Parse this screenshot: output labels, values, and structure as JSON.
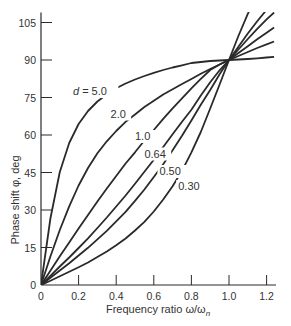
{
  "chart_data": {
    "type": "line",
    "title": "",
    "xlabel": "Frequency ratio ω/ω_n",
    "xlabel_main": "Frequency ratio ω/ω",
    "xlabel_sub": "n",
    "ylabel": "Phase shift φ, deg",
    "xlim": [
      0,
      1.25
    ],
    "ylim": [
      0,
      108
    ],
    "x_ticks": [
      0,
      0.2,
      0.4,
      0.6,
      0.8,
      1.0,
      1.2
    ],
    "x_tick_labels": [
      "0",
      "0.2",
      "0.4",
      "0.6",
      "0.8",
      "1.0",
      "1.2"
    ],
    "y_ticks": [
      0,
      15,
      30,
      45,
      60,
      75,
      90,
      105
    ],
    "y_tick_labels": [
      "0",
      "15",
      "30",
      "45",
      "60",
      "75",
      "90",
      "105"
    ],
    "grid": false,
    "legend": "inline labels on curves",
    "curve_parameter": "d",
    "x": [
      0,
      0.05,
      0.1,
      0.15,
      0.2,
      0.25,
      0.3,
      0.35,
      0.4,
      0.45,
      0.5,
      0.55,
      0.6,
      0.65,
      0.7,
      0.75,
      0.8,
      0.85,
      0.9,
      0.95,
      1.0,
      1.05,
      1.1,
      1.15,
      1.2,
      1.24
    ],
    "series": [
      {
        "name": "d = 5.0",
        "label": "d = 5.0",
        "values": [
          0,
          26.6,
          45.2,
          56.8,
          64.4,
          69.6,
          73.4,
          76.3,
          78.7,
          80.6,
          82.2,
          83.6,
          84.9,
          86.0,
          87.0,
          87.9,
          88.8,
          89.2,
          89.6,
          89.8,
          90,
          90.2,
          90.4,
          90.7,
          91.0,
          91.3
        ]
      },
      {
        "name": "d = 2.0",
        "label": "2.0",
        "values": [
          0,
          11.4,
          22.0,
          31.5,
          39.8,
          46.8,
          52.7,
          57.5,
          61.6,
          65.3,
          68.2,
          71.2,
          73.7,
          76.2,
          78.3,
          80.4,
          82.4,
          84.5,
          86.4,
          88.2,
          90,
          91.6,
          93.2,
          94.8,
          96.3,
          97.4
        ]
      },
      {
        "name": "d = 1.0",
        "label": "1.0",
        "values": [
          0,
          5.7,
          11.5,
          17.0,
          22.6,
          28.0,
          33.4,
          38.6,
          43.6,
          48.6,
          53.1,
          57.8,
          62.0,
          66.5,
          70.7,
          74.7,
          78.7,
          82.5,
          86.0,
          88.2,
          90,
          92.8,
          95.5,
          98.3,
          100.9,
          103.0
        ]
      },
      {
        "name": "d = 0.64",
        "label": "0.64",
        "values": [
          0,
          3.7,
          7.4,
          11.0,
          14.8,
          18.7,
          22.8,
          27.0,
          31.4,
          35.8,
          40.5,
          45.3,
          50.1,
          55.2,
          60.3,
          65.3,
          70.1,
          75.8,
          81.1,
          85.9,
          90,
          94.2,
          98.4,
          102.5,
          106.3,
          109.0
        ]
      },
      {
        "name": "d = 0.50",
        "label": "0.50",
        "values": [
          0,
          2.9,
          5.8,
          8.7,
          11.8,
          14.9,
          18.3,
          21.7,
          25.5,
          29.3,
          33.7,
          38.2,
          43.2,
          48.3,
          53.9,
          59.7,
          65.8,
          72.1,
          78.0,
          84.3,
          90,
          95.3,
          100.6,
          105.5,
          110.1,
          113.5
        ]
      },
      {
        "name": "d = 0.30",
        "label": "0.30",
        "values": [
          0,
          1.7,
          3.5,
          5.3,
          7.1,
          9.0,
          11.2,
          13.4,
          15.9,
          18.6,
          21.8,
          25.3,
          29.4,
          34.2,
          39.5,
          45.7,
          53.1,
          61.2,
          70.6,
          80.2,
          90,
          99.6,
          108.5,
          116.0,
          122.0,
          126.0
        ]
      }
    ],
    "annotations": [
      {
        "text": "d = 5.0",
        "x": 0.17,
        "y": 76
      },
      {
        "text": "2.0",
        "x": 0.37,
        "y": 67
      },
      {
        "text": "1.0",
        "x": 0.5,
        "y": 58
      },
      {
        "text": "0.64",
        "x": 0.55,
        "y": 51
      },
      {
        "text": "0.50",
        "x": 0.63,
        "y": 44
      },
      {
        "text": "0.30",
        "x": 0.73,
        "y": 38
      }
    ]
  }
}
